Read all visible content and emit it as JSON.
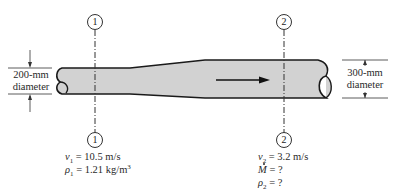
{
  "figure": {
    "type": "pipe-flow-schematic",
    "flow_direction": "left-to-right",
    "pipe_fill_color": "#d2d2d2",
    "pipe_outline_color": "#1a1a1a"
  },
  "sections": [
    {
      "id": "1",
      "label": "1",
      "diameter_label_line1": "200-mm",
      "diameter_label_line2": "diameter",
      "conditions": [
        {
          "symbol": "v",
          "sub": "1",
          "text": " = 10.5 m/s"
        },
        {
          "symbol": "ρ",
          "sub": "1",
          "text": " = 1.21 kg/m",
          "sup": "3"
        }
      ]
    },
    {
      "id": "2",
      "label": "2",
      "diameter_label_line1": "300-mm",
      "diameter_label_line2": "diameter",
      "conditions": [
        {
          "symbol": "v",
          "sub": "2",
          "text": " = 3.2 m/s"
        },
        {
          "symbol": "M",
          "sub": "",
          "text": " = ?",
          "overdot": true
        },
        {
          "symbol": "ρ",
          "sub": "2",
          "text": " = ?"
        }
      ]
    }
  ]
}
